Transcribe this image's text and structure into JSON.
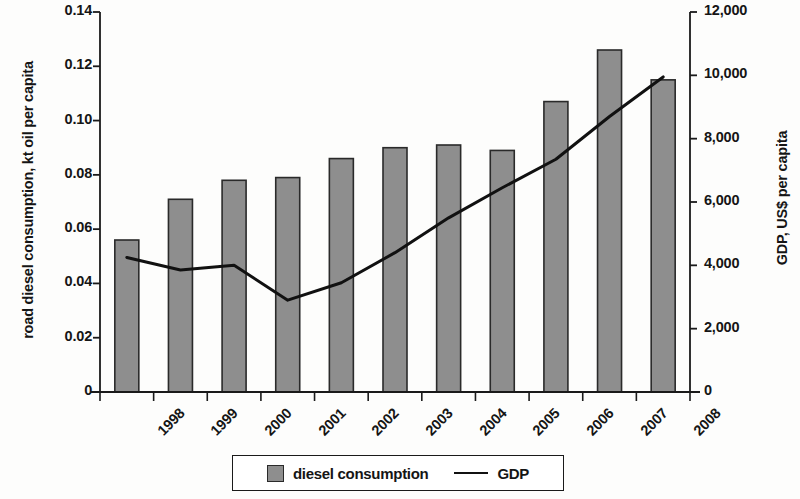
{
  "chart_data": {
    "type": "bar",
    "title": "",
    "subtitle": "",
    "xlabel": "",
    "ylabel": "road diesel consumption, kt oil per capita",
    "y2label": "GDP, US$ per capita",
    "categories": [
      "1998",
      "1999",
      "2000",
      "2001",
      "2002",
      "2003",
      "2004",
      "2005",
      "2006",
      "2007",
      "2008"
    ],
    "grid": false,
    "legend_position": "bottom-center",
    "ylim": [
      0,
      0.14
    ],
    "y2lim": [
      0,
      12000
    ],
    "yticks": [
      "0",
      "0.02",
      "0.04",
      "0.06",
      "0.08",
      "0.10",
      "0.12",
      "0.14"
    ],
    "ytick_values": [
      0,
      0.02,
      0.04,
      0.06,
      0.08,
      0.1,
      0.12,
      0.14
    ],
    "y2ticks": [
      "0",
      "2,000",
      "4,000",
      "6,000",
      "8,000",
      "10,000",
      "12,000"
    ],
    "y2tick_values": [
      0,
      2000,
      4000,
      6000,
      8000,
      10000,
      12000
    ],
    "series": [
      {
        "name": "diesel consumption",
        "type": "bar",
        "axis": "left",
        "color": "#8e8e8e",
        "edge_color": "#2a2a2a",
        "values": [
          0.056,
          0.071,
          0.078,
          0.079,
          0.086,
          0.09,
          0.091,
          0.089,
          0.107,
          0.126,
          0.115
        ]
      },
      {
        "name": "GDP",
        "type": "line",
        "axis": "right",
        "color": "#111111",
        "values": [
          4250,
          3850,
          4000,
          2900,
          3450,
          4400,
          5500,
          6450,
          7350,
          8700,
          9950
        ]
      }
    ]
  },
  "legend": {
    "items": [
      {
        "label": "diesel consumption",
        "marker": "square-swatch"
      },
      {
        "label": "GDP",
        "marker": "line-swatch"
      }
    ]
  }
}
